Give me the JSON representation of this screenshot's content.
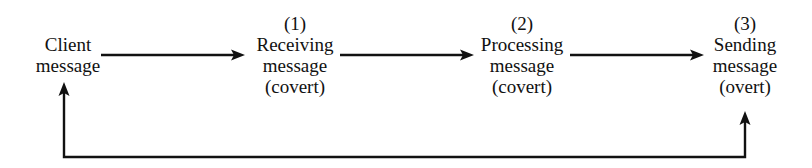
{
  "diagram": {
    "stroke_color": "#111111",
    "background_color": "#ffffff",
    "nodes": [
      {
        "id": "client",
        "number": "",
        "title": "Client",
        "subtitle": "message",
        "mode": "",
        "cx": 68,
        "top": 34
      },
      {
        "id": "receiving",
        "number": "(1)",
        "title": "Receiving",
        "subtitle": "message",
        "mode": "(covert)",
        "cx": 295,
        "top": 13
      },
      {
        "id": "processing",
        "number": "(2)",
        "title": "Processing",
        "subtitle": "message",
        "mode": "(covert)",
        "cx": 522,
        "top": 13
      },
      {
        "id": "sending",
        "number": "(3)",
        "title": "Sending",
        "subtitle": "message",
        "mode": "(overt)",
        "cx": 745,
        "top": 13
      }
    ],
    "connectors": [
      {
        "id": "client-to-receiving",
        "kind": "arrow-right",
        "label": "",
        "x1": 101,
        "y1": 55,
        "x2": 245,
        "y2": 55
      },
      {
        "id": "receiving-to-processing",
        "kind": "arrow-right",
        "label": "",
        "x1": 340,
        "y1": 55,
        "x2": 474,
        "y2": 55
      },
      {
        "id": "processing-to-sending",
        "kind": "arrow-right",
        "label": "",
        "x1": 570,
        "y1": 55,
        "x2": 704,
        "y2": 55
      }
    ],
    "feedback_loop": {
      "id": "feedback-loop",
      "label": "",
      "baseline_y": 157,
      "left_x": 64,
      "right_x": 745,
      "left_arrow_tip_y": 82,
      "right_arrow_tip_y": 111
    }
  }
}
